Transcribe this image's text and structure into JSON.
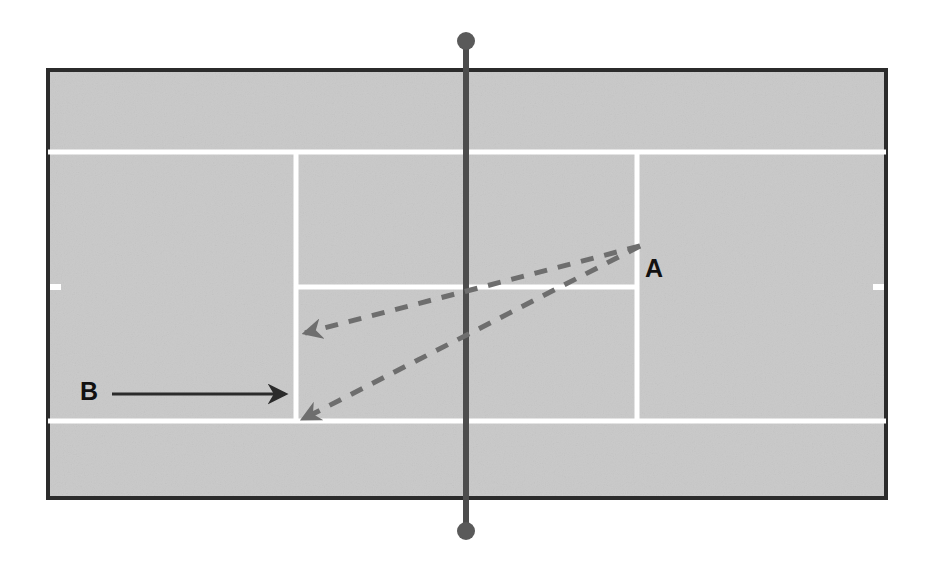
{
  "diagram": {
    "kind": "tennis-court-tactics-diagram",
    "background_color": "#ffffff",
    "court": {
      "surface_color": "#c9c9c9",
      "boundary_color": "#2b2b2b",
      "line_color": "#ffffff",
      "x": 46,
      "y": 68,
      "width": 842,
      "height": 432,
      "border_width": 4,
      "lines": {
        "top_singles_sideline_y": 152,
        "bottom_singles_sideline_y": 421,
        "left_service_line_x": 296,
        "right_service_line_x": 637,
        "center_service_line_y": 287,
        "line_thickness": 5
      },
      "side_ticks": [
        {
          "x": 46,
          "y": 287
        },
        {
          "x": 883,
          "y": 287
        }
      ]
    },
    "net": {
      "color": "#4d4d4d",
      "x": 466,
      "top_y": 41,
      "bottom_y": 531,
      "line_width": 6,
      "post_radius": 9
    },
    "labels": [
      {
        "id": "A",
        "text": "A",
        "x": 645,
        "y": 256
      },
      {
        "id": "B",
        "text": "B",
        "x": 80,
        "y": 379
      }
    ],
    "arrows": [
      {
        "id": "player-b-movement",
        "label": "B",
        "style": "solid",
        "color": "#2b2b2b",
        "stroke_width": 3,
        "from": {
          "x": 112,
          "y": 394
        },
        "to": {
          "x": 292,
          "y": 394
        }
      },
      {
        "id": "shot-a-crosscourt-short",
        "label": "A",
        "style": "dashed",
        "color": "#6e6e6e",
        "stroke_width": 5,
        "dash": "13 11",
        "from": {
          "x": 640,
          "y": 246
        },
        "to": {
          "x": 300,
          "y": 333
        }
      },
      {
        "id": "shot-a-crosscourt-deep",
        "label": "A",
        "style": "dashed",
        "color": "#6e6e6e",
        "stroke_width": 5,
        "dash": "13 11",
        "from": {
          "x": 640,
          "y": 246
        },
        "to": {
          "x": 298,
          "y": 419
        }
      }
    ]
  }
}
